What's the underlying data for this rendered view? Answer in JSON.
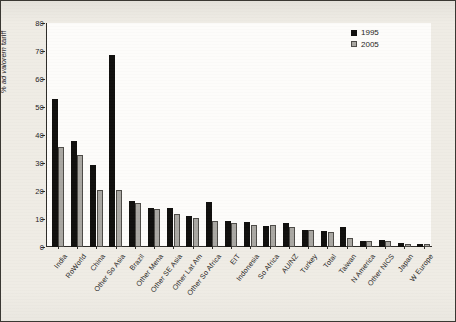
{
  "chart_data": {
    "type": "bar",
    "title": "",
    "xlabel": "",
    "ylabel": "% ad valorem tariff",
    "ylabel_prefix": "% ",
    "ylabel_italic": "ad valorem",
    "ylabel_suffix": " tariff",
    "ylim": [
      0,
      80
    ],
    "yticks": [
      0,
      10,
      20,
      30,
      40,
      50,
      60,
      70,
      80
    ],
    "grid": false,
    "legend_position": "top-right",
    "categories": [
      "India",
      "RoWorld",
      "China",
      "Other So Asia",
      "Brazil",
      "Other Mena",
      "Other SE Asia",
      "Other Lat Am",
      "Other So Africa",
      "EIT",
      "Indonesia",
      "So Africa",
      "AU/NZ",
      "Turkey",
      "Total",
      "Taiwan",
      "N America",
      "Other NICS",
      "Japan",
      "W Europe"
    ],
    "series": [
      {
        "name": "1995",
        "color": "#100f0d",
        "values": [
          52.7,
          37.9,
          29.4,
          68.4,
          16.6,
          14.1,
          13.8,
          10.9,
          16.2,
          9.3,
          8.9,
          7.6,
          8.4,
          6.1,
          5.8,
          7.3,
          2.3,
          2.5,
          1.4,
          1.2
        ]
      },
      {
        "name": "2005",
        "color": "#a9a7a2",
        "values": [
          35.6,
          32.8,
          20.3,
          20.2,
          15.6,
          13.7,
          11.8,
          10.4,
          9.2,
          8.5,
          7.8,
          7.9,
          7.1,
          6.0,
          5.2,
          3.2,
          2.2,
          2.3,
          1.1,
          1.0
        ]
      }
    ]
  },
  "legend": {
    "items": [
      {
        "label": "1995"
      },
      {
        "label": "2005"
      }
    ]
  }
}
